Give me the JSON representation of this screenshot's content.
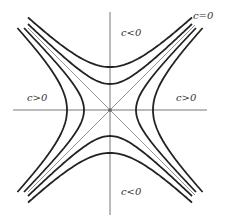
{
  "diagram": {
    "center": [
      110,
      110
    ],
    "axes": {
      "horizontal": {
        "x1": 13,
        "x2": 207,
        "y": 110
      },
      "vertical": {
        "x": 110,
        "y1": 12,
        "y2": 215
      }
    },
    "asymptotes": [
      {
        "x1": 28,
        "y1": 28,
        "x2": 195,
        "y2": 195
      },
      {
        "x1": 195,
        "y1": 25,
        "x2": 28,
        "y2": 192
      }
    ],
    "hyperbolas": [
      {
        "orientation": "horizontal",
        "a": 43,
        "extent": 82,
        "label": "c>0"
      },
      {
        "orientation": "horizontal",
        "a": 26,
        "extent": 82,
        "label": "c>0"
      },
      {
        "orientation": "vertical",
        "a": 43,
        "extent": 82,
        "label": "c<0"
      },
      {
        "orientation": "vertical",
        "a": 26,
        "extent": 82,
        "label": "c<0"
      }
    ],
    "labels": [
      {
        "id": "top",
        "text": "c<0",
        "x": 121,
        "y": 36
      },
      {
        "id": "topright",
        "text": "c=0",
        "x": 193,
        "y": 19
      },
      {
        "id": "left",
        "text": "c>0",
        "x": 27,
        "y": 101
      },
      {
        "id": "right",
        "text": "c>0",
        "x": 176,
        "y": 101
      },
      {
        "id": "bottom",
        "text": "c<0",
        "x": 121,
        "y": 195
      }
    ]
  }
}
